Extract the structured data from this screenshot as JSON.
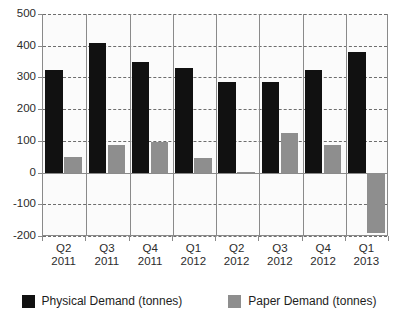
{
  "chart_data": {
    "type": "bar",
    "title": "",
    "subtitle": "",
    "xlabel": "",
    "ylabel": "",
    "ylim": [
      -200,
      500
    ],
    "yticks": [
      500,
      400,
      300,
      200,
      100,
      0,
      -100,
      -200
    ],
    "ytick_labels": [
      "500",
      "400",
      "300",
      "200",
      "100",
      "0",
      "-100",
      "-200"
    ],
    "grid": true,
    "legend_position": "bottom",
    "categories": [
      "Q2 2011",
      "Q3 2011",
      "Q4 2011",
      "Q1 2012",
      "Q2 2012",
      "Q3 2012",
      "Q4 2012",
      "Q1 2013"
    ],
    "category_quarters": [
      "Q2",
      "Q3",
      "Q4",
      "Q1",
      "Q2",
      "Q3",
      "Q4",
      "Q1"
    ],
    "category_years": [
      "2011",
      "2011",
      "2011",
      "2012",
      "2012",
      "2012",
      "2012",
      "2013"
    ],
    "series": [
      {
        "name": "Physical Demand (tonnes)",
        "color": "#111111",
        "values": [
          325,
          410,
          350,
          330,
          285,
          285,
          325,
          380
        ]
      },
      {
        "name": "Paper Demand (tonnes)",
        "color": "#8e8e8e",
        "values": [
          48,
          88,
          97,
          45,
          2,
          125,
          88,
          -190
        ]
      }
    ]
  },
  "legend": {
    "items": [
      {
        "label": "Physical Demand (tonnes)",
        "color": "#111111",
        "swatch_name": "legend-swatch-physical-demand"
      },
      {
        "label": "Paper Demand (tonnes)",
        "color": "#8e8e8e",
        "swatch_name": "legend-swatch-paper-demand"
      }
    ]
  }
}
